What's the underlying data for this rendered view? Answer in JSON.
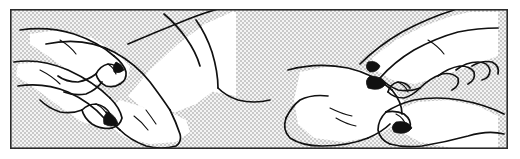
{
  "document": {
    "title": "Ankle mobilization technique illustration",
    "kind": "line-art-illustration",
    "width": 520,
    "height": 159
  },
  "frame": {
    "name": "illustration-frame",
    "border_color": "#2b2b2b",
    "border_width": 1.6,
    "x": 10,
    "y": 9,
    "width": 498,
    "height": 140
  },
  "canvas": {
    "page_background": "#ffffff",
    "panel_background": "#e2e2e2",
    "stipple_pattern": "checkerboard-dither",
    "ink_color": "#111111",
    "figure_fill": "#ffffff"
  },
  "panels": [
    {
      "id": "panel-left",
      "name": "left-illustration",
      "description": "Two hands grasping a patient's ankle and heel from the medial side; forearm and lower leg extend to the upper right of the frame.",
      "elements": [
        {
          "name": "practitioner-upper-hand",
          "description": "Upper hand with thumb and fingers pressing the front of the ankle joint"
        },
        {
          "name": "practitioner-lower-hand",
          "description": "Lower hand cupping the heel from beneath"
        },
        {
          "name": "patient-lower-leg",
          "description": "Patient's shin and calf sloping up to the right"
        },
        {
          "name": "patient-foot",
          "description": "Patient's foot and heel pointing down-right"
        }
      ]
    },
    {
      "id": "panel-right",
      "name": "right-illustration",
      "description": "Two hands grasping a patient's forefoot and heel; practitioner's forearm enters from the upper right and a second forearm from the lower right.",
      "elements": [
        {
          "name": "practitioner-upper-hand",
          "description": "Upper hand with four extended fingers curling over the top of the foot"
        },
        {
          "name": "practitioner-lower-hand",
          "description": "Lower hand supporting the sole and heel"
        },
        {
          "name": "patient-foot",
          "description": "Patient's foot seen from the side, toes toward the left"
        },
        {
          "name": "practitioner-forearm",
          "description": "Forearm extending to the right frame edge"
        }
      ]
    }
  ],
  "annotations": {
    "has_text_labels": false,
    "has_caption": false,
    "label_text": ""
  }
}
